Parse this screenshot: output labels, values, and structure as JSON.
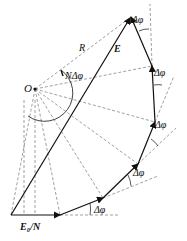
{
  "diagram": {
    "type": "phasor-diagram",
    "labels": {
      "resultant": "E",
      "radius": "R",
      "center": "O",
      "total_angle": "NΔφ",
      "step_angle": "Δφ",
      "unit_phasor": "E₀/N"
    },
    "center": [
      35,
      89
    ],
    "phasor_points": [
      [
        11,
        215
      ],
      [
        60,
        215
      ],
      [
        103,
        198
      ],
      [
        138,
        164
      ],
      [
        155,
        122
      ],
      [
        152,
        66
      ],
      [
        131,
        17
      ]
    ],
    "step_angle_label_positions": [
      [
        77,
        204
      ],
      [
        123,
        158
      ],
      [
        157,
        110
      ],
      [
        155,
        76
      ],
      [
        141,
        16
      ]
    ],
    "colors": {
      "line": "#111111",
      "dashed": "#777777",
      "background": "#ffffff"
    }
  }
}
